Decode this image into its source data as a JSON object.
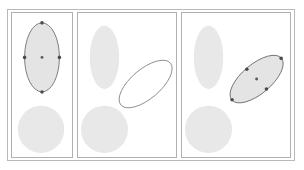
{
  "figure": {
    "frame_count": 3,
    "background_color": "#ffffff",
    "outer_border_color": "#b9b9b9",
    "panel_border_color": "#b0b0b0"
  },
  "palette": {
    "shape_fill": "#e8e8e8",
    "selected_shape_fill": "#e4e4e4",
    "selected_outline": "#6e6e6e",
    "preview_outline": "#8a8a8a",
    "handle_color": "#4a4a4a"
  },
  "panels": [
    {
      "id": "panel-1",
      "label": "Frame 1 - ellipse selected",
      "shapes": [
        {
          "name": "selected-ellipse",
          "type": "ellipse",
          "cx": 31,
          "cy": 45,
          "rx": 18,
          "ry": 35,
          "rotation": 0,
          "selected": true,
          "filled": true
        },
        {
          "name": "static-circle",
          "type": "ellipse",
          "cx": 30,
          "cy": 118,
          "rx": 24,
          "ry": 24,
          "rotation": 0,
          "selected": false,
          "filled": true
        }
      ],
      "handles": [
        {
          "name": "handle-top",
          "x": 31,
          "y": 10
        },
        {
          "name": "handle-bottom",
          "x": 31,
          "y": 80
        },
        {
          "name": "handle-left",
          "x": 13,
          "y": 45
        },
        {
          "name": "handle-right",
          "x": 49,
          "y": 45
        },
        {
          "name": "handle-center",
          "x": 31,
          "y": 45
        }
      ]
    },
    {
      "id": "panel-2",
      "label": "Frame 2 - rotation drag preview",
      "shapes": [
        {
          "name": "static-ellipse",
          "type": "ellipse",
          "cx": 27,
          "cy": 45,
          "rx": 15,
          "ry": 32,
          "rotation": 0,
          "selected": false,
          "filled": true
        },
        {
          "name": "static-circle",
          "type": "ellipse",
          "cx": 27,
          "cy": 118,
          "rx": 24,
          "ry": 24,
          "rotation": 0,
          "selected": false,
          "filled": true
        },
        {
          "name": "rotation-preview-ellipse",
          "type": "ellipse",
          "cx": 69,
          "cy": 72,
          "rx": 33,
          "ry": 15,
          "rotation": -40,
          "selected": false,
          "filled": false
        }
      ],
      "handles": []
    },
    {
      "id": "panel-3",
      "label": "Frame 3 - ellipse rotated and selected",
      "shapes": [
        {
          "name": "static-ellipse",
          "type": "ellipse",
          "cx": 27,
          "cy": 45,
          "rx": 15,
          "ry": 32,
          "rotation": 0,
          "selected": false,
          "filled": true
        },
        {
          "name": "static-circle",
          "type": "ellipse",
          "cx": 27,
          "cy": 118,
          "rx": 24,
          "ry": 24,
          "rotation": 0,
          "selected": false,
          "filled": true
        },
        {
          "name": "rotated-selected-ellipse",
          "type": "ellipse",
          "cx": 76,
          "cy": 67,
          "rx": 33,
          "ry": 15,
          "rotation": -40,
          "selected": true,
          "filled": true
        }
      ],
      "handles": [
        {
          "name": "handle-major-start",
          "x": 51,
          "y": 88
        },
        {
          "name": "handle-major-end",
          "x": 101,
          "y": 46
        },
        {
          "name": "handle-minor-start",
          "x": 66,
          "y": 57
        },
        {
          "name": "handle-minor-end",
          "x": 86,
          "y": 77
        },
        {
          "name": "handle-center",
          "x": 76,
          "y": 67
        }
      ]
    }
  ]
}
